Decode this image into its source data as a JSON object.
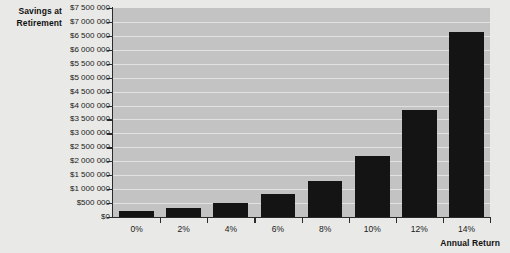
{
  "chart_data": {
    "type": "bar",
    "title": "",
    "ylabel": "Savings at Retirement",
    "xlabel": "Annual Return",
    "categories": [
      "0%",
      "2%",
      "4%",
      "6%",
      "8%",
      "10%",
      "12%",
      "14%"
    ],
    "values": [
      215000,
      325000,
      500000,
      820000,
      1300000,
      2200000,
      3850000,
      6650000
    ],
    "ylim": [
      0,
      7500000
    ],
    "ytick_labels": [
      "$7 500 000",
      "$7 000 000",
      "$6 500 000",
      "$6 000 000",
      "$5 500 000",
      "$5 000 000",
      "$4 500 000",
      "$4 000 000",
      "$3 500 000",
      "$3 000 000",
      "$2 500 000",
      "$2 000 000",
      "$1 500 000",
      "$1 000 000",
      "$500 000",
      "$0"
    ],
    "ytick_values": [
      7500000,
      7000000,
      6500000,
      6000000,
      5500000,
      5000000,
      4500000,
      4000000,
      3500000,
      3000000,
      2500000,
      2000000,
      1500000,
      1000000,
      500000,
      0
    ],
    "grid": true,
    "legend": "none",
    "colors": {
      "bar": "#141414",
      "plot_background": "#c3c3c3",
      "page_background": "#e9e9e7",
      "gridline": "#e2e2e0",
      "axis": "#2b2b2b",
      "text": "#1a1a1a"
    }
  },
  "axis_titles": {
    "y_line1": "Savings at",
    "y_line2": "Retirement",
    "x": "Annual Return"
  }
}
